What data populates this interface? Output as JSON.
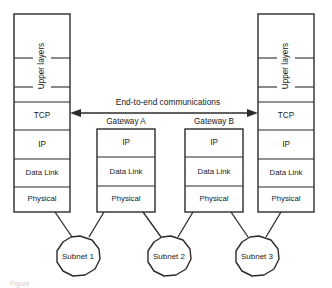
{
  "figure": {
    "background_color": "#ffffff",
    "line_color": "#2b2b2b"
  },
  "arrow": {
    "label": "End-to-end communications",
    "style": "double-headed",
    "from": "TCP",
    "to": "TCP"
  },
  "hosts": [
    {
      "id": "left-host",
      "upper_label": "Upper layers",
      "upper_sublayer_count": 3,
      "layers": [
        "TCP",
        "IP",
        "Data Link",
        "Physical"
      ],
      "connects_to": "Subnet 1"
    },
    {
      "id": "right-host",
      "upper_label": "Upper layers",
      "upper_sublayer_count": 3,
      "layers": [
        "TCP",
        "IP",
        "Data Link",
        "Physical"
      ],
      "connects_to": "Subnet 3"
    }
  ],
  "gateways": [
    {
      "id": "gateway-a",
      "title": "Gateway A",
      "layers": [
        "IP",
        "Data Link",
        "Physical"
      ],
      "connects_to": [
        "Subnet 1",
        "Subnet 2"
      ]
    },
    {
      "id": "gateway-b",
      "title": "Gateway B",
      "layers": [
        "IP",
        "Data Link",
        "Physical"
      ],
      "connects_to": [
        "Subnet 2",
        "Subnet 3"
      ]
    }
  ],
  "subnets": [
    {
      "id": "subnet-1",
      "label": "Subnet 1"
    },
    {
      "id": "subnet-2",
      "label": "Subnet 2"
    },
    {
      "id": "subnet-3",
      "label": "Subnet 3"
    }
  ],
  "caption": {
    "text": "Figure"
  }
}
